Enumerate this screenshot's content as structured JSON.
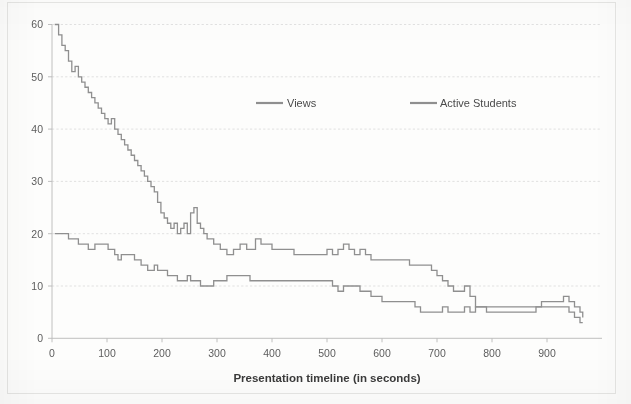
{
  "chart_data": {
    "type": "line",
    "title": "",
    "xlabel": "Presentation timeline (in seconds)",
    "ylabel": "",
    "xlim": [
      0,
      1000
    ],
    "ylim": [
      0,
      60
    ],
    "xticks": [
      0,
      100,
      200,
      300,
      400,
      500,
      600,
      700,
      800,
      900
    ],
    "yticks": [
      0,
      10,
      20,
      30,
      40,
      50,
      60
    ],
    "grid": true,
    "legend_position": "upper-center",
    "line_color": "#8f8f8f",
    "series": [
      {
        "name": "Views",
        "color": "#8f8f8f",
        "x": [
          5,
          12,
          18,
          24,
          30,
          36,
          42,
          48,
          54,
          60,
          66,
          72,
          78,
          84,
          90,
          96,
          102,
          108,
          114,
          120,
          126,
          132,
          138,
          144,
          150,
          156,
          162,
          168,
          174,
          180,
          186,
          192,
          198,
          204,
          210,
          216,
          222,
          228,
          234,
          240,
          246,
          252,
          258,
          264,
          270,
          276,
          282,
          288,
          294,
          300,
          306,
          312,
          318,
          324,
          330,
          336,
          342,
          348,
          354,
          360,
          370,
          380,
          390,
          400,
          410,
          420,
          430,
          440,
          450,
          460,
          470,
          480,
          490,
          500,
          510,
          520,
          530,
          540,
          550,
          560,
          570,
          580,
          590,
          600,
          610,
          620,
          630,
          640,
          650,
          660,
          670,
          680,
          690,
          700,
          710,
          720,
          730,
          740,
          750,
          760,
          770,
          780,
          790,
          800,
          810,
          820,
          830,
          840,
          850,
          860,
          870,
          880,
          890,
          900,
          910,
          920,
          930,
          940,
          950,
          960,
          965
        ],
        "y": [
          60,
          58,
          56,
          55,
          53,
          51,
          52,
          50,
          49,
          48,
          47,
          46,
          45,
          44,
          43,
          42,
          41,
          42,
          40,
          39,
          38,
          37,
          36,
          35,
          34,
          33,
          32,
          31,
          30,
          29,
          28,
          26,
          24,
          23,
          22,
          21,
          22,
          20,
          21,
          22,
          20,
          24,
          25,
          22,
          21,
          20,
          19,
          19,
          18,
          18,
          17,
          17,
          16,
          16,
          17,
          17,
          18,
          18,
          17,
          17,
          19,
          18,
          18,
          17,
          17,
          17,
          17,
          16,
          16,
          16,
          16,
          16,
          16,
          17,
          16,
          17,
          18,
          17,
          16,
          17,
          16,
          15,
          15,
          15,
          15,
          15,
          15,
          15,
          14,
          14,
          14,
          14,
          13,
          12,
          11,
          10,
          9,
          9,
          10,
          8,
          6,
          6,
          6,
          6,
          6,
          6,
          6,
          6,
          6,
          6,
          6,
          6,
          7,
          7,
          7,
          7,
          8,
          7,
          6,
          5,
          4
        ],
        "start_value": 60,
        "end_value": 4
      },
      {
        "name": "Active Students",
        "color": "#8f8f8f",
        "x": [
          5,
          12,
          18,
          24,
          30,
          36,
          42,
          48,
          54,
          60,
          66,
          72,
          78,
          84,
          90,
          96,
          102,
          108,
          114,
          120,
          126,
          132,
          138,
          144,
          150,
          156,
          162,
          168,
          174,
          180,
          186,
          192,
          198,
          204,
          210,
          216,
          222,
          228,
          234,
          240,
          246,
          252,
          258,
          264,
          270,
          276,
          282,
          288,
          294,
          300,
          306,
          312,
          318,
          324,
          330,
          336,
          342,
          348,
          354,
          360,
          370,
          380,
          390,
          400,
          410,
          420,
          430,
          440,
          450,
          460,
          470,
          480,
          490,
          500,
          510,
          520,
          530,
          540,
          550,
          560,
          570,
          580,
          590,
          600,
          610,
          620,
          630,
          640,
          650,
          660,
          670,
          680,
          690,
          700,
          710,
          720,
          730,
          740,
          750,
          760,
          770,
          780,
          790,
          800,
          810,
          820,
          830,
          840,
          850,
          860,
          870,
          880,
          890,
          900,
          910,
          920,
          930,
          940,
          950,
          960,
          965
        ],
        "y": [
          20,
          20,
          20,
          20,
          19,
          19,
          19,
          18,
          18,
          18,
          17,
          17,
          18,
          18,
          18,
          18,
          17,
          17,
          16,
          15,
          16,
          16,
          16,
          16,
          15,
          15,
          14,
          14,
          13,
          13,
          14,
          13,
          13,
          13,
          12,
          12,
          12,
          11,
          11,
          11,
          12,
          11,
          11,
          11,
          10,
          10,
          10,
          10,
          11,
          11,
          11,
          11,
          12,
          12,
          12,
          12,
          12,
          12,
          12,
          11,
          11,
          11,
          11,
          11,
          11,
          11,
          11,
          11,
          11,
          11,
          11,
          11,
          11,
          11,
          10,
          9,
          10,
          10,
          10,
          9,
          9,
          8,
          8,
          7,
          7,
          7,
          7,
          7,
          7,
          6,
          5,
          5,
          5,
          5,
          6,
          5,
          5,
          5,
          6,
          5,
          6,
          6,
          5,
          5,
          5,
          5,
          5,
          5,
          5,
          5,
          5,
          6,
          6,
          6,
          6,
          6,
          6,
          5,
          4,
          3,
          3
        ],
        "start_value": 20,
        "end_value": 3
      }
    ]
  },
  "legend": {
    "items": [
      {
        "label": "Views"
      },
      {
        "label": "Active Students"
      }
    ]
  },
  "axes": {
    "x_title": "Presentation timeline (in seconds)",
    "x_tick_labels": [
      "0",
      "100",
      "200",
      "300",
      "400",
      "500",
      "600",
      "700",
      "800",
      "900"
    ],
    "y_tick_labels": [
      "0",
      "10",
      "20",
      "30",
      "40",
      "50",
      "60"
    ]
  }
}
